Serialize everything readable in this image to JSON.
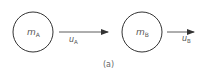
{
  "diagram": {
    "caption": "(a)",
    "bodies": [
      {
        "id": "A",
        "mass_symbol": "m",
        "mass_subscript": "A"
      },
      {
        "id": "B",
        "mass_symbol": "m",
        "mass_subscript": "B"
      }
    ],
    "velocities": [
      {
        "id": "A",
        "symbol": "u",
        "subscript": "A",
        "direction": "right"
      },
      {
        "id": "B",
        "symbol": "u",
        "subscript": "B",
        "direction": "right"
      }
    ],
    "colors": {
      "stroke": "#333333",
      "text": "#555555"
    }
  }
}
